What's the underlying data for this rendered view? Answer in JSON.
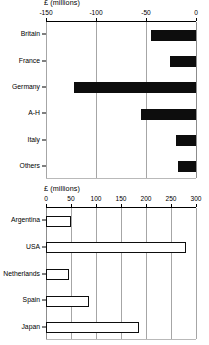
{
  "chart_data": [
    {
      "id": "top",
      "type": "bar",
      "orientation": "horizontal",
      "title": "£ (millions)",
      "xlabel": "£ (millions)",
      "ylabel": "",
      "categories": [
        "Britain",
        "France",
        "Germany",
        "A-H",
        "Italy",
        "Others"
      ],
      "values": [
        -45,
        -26,
        -122,
        -55,
        -20,
        -18
      ],
      "xlim": [
        -150,
        0
      ],
      "xticks": [
        -150,
        -100,
        -50,
        0
      ],
      "xticklabels": [
        "-150",
        "-100",
        "-50",
        "0"
      ],
      "grid": true,
      "legend": "none",
      "bar_style": "filled",
      "bar_color": "#0d0d0d"
    },
    {
      "id": "bottom",
      "type": "bar",
      "orientation": "horizontal",
      "title": "£ (millions)",
      "xlabel": "£ (millions)",
      "ylabel": "",
      "categories": [
        "Argentina",
        "USA",
        "Netherlands",
        "Spain",
        "Japan"
      ],
      "values": [
        50,
        280,
        45,
        85,
        185
      ],
      "xlim": [
        0,
        300
      ],
      "xticks": [
        0,
        50,
        100,
        150,
        200,
        250,
        300
      ],
      "xticklabels": [
        "0",
        "50",
        "100",
        "150",
        "200",
        "250",
        "300"
      ],
      "grid": true,
      "legend": "none",
      "bar_style": "outlined",
      "bar_color": "#ffffff",
      "bar_edge_color": "#0d0d0d"
    }
  ],
  "colors": {
    "background": "#ffffff",
    "foreground": "#000000",
    "gridline": "#a6a6a6",
    "bar_fill": "#0d0d0d",
    "bar_outline": "#0d0d0d"
  }
}
